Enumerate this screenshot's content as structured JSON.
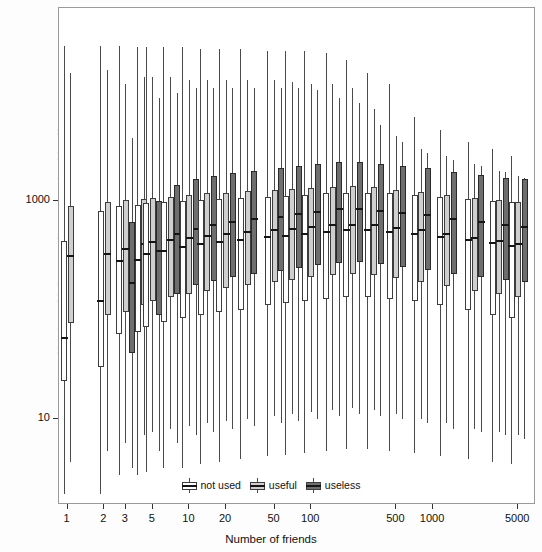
{
  "chart_data": {
    "type": "boxplot",
    "title": "",
    "xlabel": "Number of friends",
    "ylabel": "Number of followers of users used to identify you",
    "xscale": "log",
    "yscale": "log",
    "xlim": [
      0.85,
      7000
    ],
    "ylim": [
      1.6,
      60000
    ],
    "x_ticks": [
      {
        "value": 1,
        "label": "1"
      },
      {
        "value": 2,
        "label": "2"
      },
      {
        "value": 3,
        "label": "3"
      },
      {
        "value": 5,
        "label": "5"
      },
      {
        "value": 10,
        "label": "10"
      },
      {
        "value": 20,
        "label": "20"
      },
      {
        "value": 50,
        "label": "50"
      },
      {
        "value": 100,
        "label": "100"
      },
      {
        "value": 500,
        "label": "500"
      },
      {
        "value": 1000,
        "label": "1000"
      },
      {
        "value": 5000,
        "label": "5000"
      }
    ],
    "y_ticks": [
      {
        "value": 10,
        "label": "10"
      },
      {
        "value": 1000,
        "label": "1000"
      }
    ],
    "grid": false,
    "legend_position": "bottom-center",
    "series": [
      {
        "name": "not used",
        "fill": "#ffffff",
        "stroke": "#3d3d3d"
      },
      {
        "name": "useful",
        "fill": "#cfcfcf",
        "stroke": "#3d3d3d"
      },
      {
        "name": "useless",
        "fill": "#6e6e6e",
        "stroke": "#2a2a2a"
      }
    ],
    "groups": [
      {
        "x": 1,
        "boxes": [
          {
            "series": "not used",
            "lower_whisker": 2.0,
            "q1": 22,
            "median": 55,
            "q3": 430,
            "upper_whisker": 27000
          },
          {
            "series": "useful",
            "lower_whisker": 4.0,
            "q1": 75,
            "median": 310,
            "q3": 900,
            "upper_whisker": 15000
          }
        ]
      },
      {
        "x": 2,
        "boxes": [
          {
            "series": "not used",
            "lower_whisker": 2.0,
            "q1": 30,
            "median": 120,
            "q3": 820,
            "upper_whisker": 27000
          },
          {
            "series": "useful",
            "lower_whisker": 5.0,
            "q1": 90,
            "median": 330,
            "q3": 980,
            "upper_whisker": 16000
          }
        ]
      },
      {
        "x": 3,
        "boxes": [
          {
            "series": "not used",
            "lower_whisker": 3.0,
            "q1": 60,
            "median": 280,
            "q3": 900,
            "upper_whisker": 27000
          },
          {
            "series": "useful",
            "lower_whisker": 6.0,
            "q1": 95,
            "median": 360,
            "q3": 1020,
            "upper_whisker": 12000
          },
          {
            "series": "useless",
            "lower_whisker": 3.5,
            "q1": 40,
            "median": 175,
            "q3": 640,
            "upper_whisker": 3800
          }
        ]
      },
      {
        "x": 4,
        "boxes": [
          {
            "series": "not used",
            "lower_whisker": 3.0,
            "q1": 62,
            "median": 290,
            "q3": 930,
            "upper_whisker": 26000
          },
          {
            "series": "useful",
            "lower_whisker": 7.0,
            "q1": 110,
            "median": 400,
            "q3": 1050,
            "upper_whisker": 14000
          }
        ]
      },
      {
        "x": 5,
        "boxes": [
          {
            "series": "not used",
            "lower_whisker": 3.2,
            "q1": 70,
            "median": 330,
            "q3": 960,
            "upper_whisker": 26000
          },
          {
            "series": "useful",
            "lower_whisker": 7.5,
            "q1": 120,
            "median": 420,
            "q3": 1080,
            "upper_whisker": 14000
          },
          {
            "series": "useless",
            "lower_whisker": 5.0,
            "q1": 90,
            "median": 350,
            "q3": 1000,
            "upper_whisker": 9000
          }
        ]
      },
      {
        "x": 7,
        "boxes": [
          {
            "series": "not used",
            "lower_whisker": 3.5,
            "q1": 78,
            "median": 350,
            "q3": 980,
            "upper_whisker": 26000
          },
          {
            "series": "useful",
            "lower_whisker": 8.0,
            "q1": 130,
            "median": 440,
            "q3": 1100,
            "upper_whisker": 14000
          },
          {
            "series": "useless",
            "lower_whisker": 6.0,
            "q1": 140,
            "median": 500,
            "q3": 1400,
            "upper_whisker": 10000
          }
        ]
      },
      {
        "x": 10,
        "boxes": [
          {
            "series": "not used",
            "lower_whisker": 3.5,
            "q1": 85,
            "median": 380,
            "q3": 1000,
            "upper_whisker": 26000
          },
          {
            "series": "useful",
            "lower_whisker": 8.5,
            "q1": 140,
            "median": 460,
            "q3": 1150,
            "upper_whisker": 13000
          },
          {
            "series": "useless",
            "lower_whisker": 7.0,
            "q1": 170,
            "median": 560,
            "q3": 1600,
            "upper_whisker": 11000
          }
        ]
      },
      {
        "x": 14,
        "boxes": [
          {
            "series": "not used",
            "lower_whisker": 3.8,
            "q1": 90,
            "median": 400,
            "q3": 1020,
            "upper_whisker": 25000
          },
          {
            "series": "useful",
            "lower_whisker": 9.0,
            "q1": 150,
            "median": 480,
            "q3": 1180,
            "upper_whisker": 13000
          },
          {
            "series": "useless",
            "lower_whisker": 7.5,
            "q1": 185,
            "median": 600,
            "q3": 1700,
            "upper_whisker": 11000
          }
        ]
      },
      {
        "x": 20,
        "boxes": [
          {
            "series": "not used",
            "lower_whisker": 4.0,
            "q1": 95,
            "median": 420,
            "q3": 1050,
            "upper_whisker": 25000
          },
          {
            "series": "useful",
            "lower_whisker": 9.5,
            "q1": 160,
            "median": 500,
            "q3": 1200,
            "upper_whisker": 13000
          },
          {
            "series": "useless",
            "lower_whisker": 8.0,
            "q1": 200,
            "median": 640,
            "q3": 1800,
            "upper_whisker": 11000
          }
        ]
      },
      {
        "x": 30,
        "boxes": [
          {
            "series": "not used",
            "lower_whisker": 4.2,
            "q1": 100,
            "median": 440,
            "q3": 1080,
            "upper_whisker": 25000
          },
          {
            "series": "useful",
            "lower_whisker": 10.0,
            "q1": 170,
            "median": 520,
            "q3": 1250,
            "upper_whisker": 13000
          },
          {
            "series": "useless",
            "lower_whisker": 8.5,
            "q1": 215,
            "median": 680,
            "q3": 1900,
            "upper_whisker": 11000
          }
        ]
      },
      {
        "x": 50,
        "boxes": [
          {
            "series": "not used",
            "lower_whisker": 4.5,
            "q1": 110,
            "median": 470,
            "q3": 1100,
            "upper_whisker": 24000
          },
          {
            "series": "useful",
            "lower_whisker": 10.5,
            "q1": 180,
            "median": 540,
            "q3": 1280,
            "upper_whisker": 13000
          },
          {
            "series": "useless",
            "lower_whisker": 9.0,
            "q1": 230,
            "median": 720,
            "q3": 2000,
            "upper_whisker": 11000
          }
        ]
      },
      {
        "x": 70,
        "boxes": [
          {
            "series": "not used",
            "lower_whisker": 4.6,
            "q1": 115,
            "median": 480,
            "q3": 1120,
            "upper_whisker": 24000
          },
          {
            "series": "useful",
            "lower_whisker": 11.0,
            "q1": 190,
            "median": 560,
            "q3": 1300,
            "upper_whisker": 12500
          },
          {
            "series": "useless",
            "lower_whisker": 9.5,
            "q1": 245,
            "median": 760,
            "q3": 2100,
            "upper_whisker": 11000
          }
        ]
      },
      {
        "x": 100,
        "boxes": [
          {
            "series": "not used",
            "lower_whisker": 4.8,
            "q1": 120,
            "median": 500,
            "q3": 1150,
            "upper_whisker": 24000
          },
          {
            "series": "useful",
            "lower_whisker": 11.5,
            "q1": 200,
            "median": 580,
            "q3": 1320,
            "upper_whisker": 12000
          },
          {
            "series": "useless",
            "lower_whisker": 10.0,
            "q1": 260,
            "median": 800,
            "q3": 2200,
            "upper_whisker": 10500
          }
        ]
      },
      {
        "x": 150,
        "boxes": [
          {
            "series": "not used",
            "lower_whisker": 5.0,
            "q1": 125,
            "median": 520,
            "q3": 1180,
            "upper_whisker": 23000
          },
          {
            "series": "useful",
            "lower_whisker": 12.0,
            "q1": 210,
            "median": 600,
            "q3": 1350,
            "upper_whisker": 12000
          },
          {
            "series": "useless",
            "lower_whisker": 10.5,
            "q1": 270,
            "median": 840,
            "q3": 2300,
            "upper_whisker": 9000
          }
        ]
      },
      {
        "x": 220,
        "boxes": [
          {
            "series": "not used",
            "lower_whisker": 5.2,
            "q1": 130,
            "median": 540,
            "q3": 1200,
            "upper_whisker": 20000
          },
          {
            "series": "useful",
            "lower_whisker": 12.5,
            "q1": 215,
            "median": 610,
            "q3": 1380,
            "upper_whisker": 11000
          },
          {
            "series": "useless",
            "lower_whisker": 11.0,
            "q1": 275,
            "median": 850,
            "q3": 2300,
            "upper_whisker": 8000
          }
        ]
      },
      {
        "x": 330,
        "boxes": [
          {
            "series": "not used",
            "lower_whisker": 5.2,
            "q1": 130,
            "median": 540,
            "q3": 1200,
            "upper_whisker": 15000
          },
          {
            "series": "useful",
            "lower_whisker": 12.0,
            "q1": 210,
            "median": 600,
            "q3": 1350,
            "upper_whisker": 7000
          },
          {
            "series": "useless",
            "lower_whisker": 10.5,
            "q1": 265,
            "median": 820,
            "q3": 2200,
            "upper_whisker": 5000
          }
        ]
      },
      {
        "x": 500,
        "boxes": [
          {
            "series": "not used",
            "lower_whisker": 5.0,
            "q1": 125,
            "median": 520,
            "q3": 1180,
            "upper_whisker": 12000
          },
          {
            "series": "useful",
            "lower_whisker": 11.0,
            "q1": 195,
            "median": 570,
            "q3": 1280,
            "upper_whisker": 4000
          },
          {
            "series": "useless",
            "lower_whisker": 10.0,
            "q1": 250,
            "median": 780,
            "q3": 2100,
            "upper_whisker": 3500
          }
        ]
      },
      {
        "x": 800,
        "boxes": [
          {
            "series": "not used",
            "lower_whisker": 4.8,
            "q1": 120,
            "median": 500,
            "q3": 1150,
            "upper_whisker": 6000
          },
          {
            "series": "useful",
            "lower_whisker": 10.0,
            "q1": 180,
            "median": 540,
            "q3": 1220,
            "upper_whisker": 3000
          },
          {
            "series": "useless",
            "lower_whisker": 9.0,
            "q1": 235,
            "median": 740,
            "q3": 2000,
            "upper_whisker": 2800
          }
        ]
      },
      {
        "x": 1300,
        "boxes": [
          {
            "series": "not used",
            "lower_whisker": 4.5,
            "q1": 110,
            "median": 470,
            "q3": 1100,
            "upper_whisker": 4500
          },
          {
            "series": "useful",
            "lower_whisker": 9.0,
            "q1": 165,
            "median": 500,
            "q3": 1150,
            "upper_whisker": 2600
          },
          {
            "series": "useless",
            "lower_whisker": 8.0,
            "q1": 215,
            "median": 680,
            "q3": 1850,
            "upper_whisker": 2400
          }
        ]
      },
      {
        "x": 2200,
        "boxes": [
          {
            "series": "not used",
            "lower_whisker": 4.2,
            "q1": 100,
            "median": 440,
            "q3": 1050,
            "upper_whisker": 3500
          },
          {
            "series": "useful",
            "lower_whisker": 8.0,
            "q1": 150,
            "median": 460,
            "q3": 1080,
            "upper_whisker": 2200
          },
          {
            "series": "useless",
            "lower_whisker": 7.5,
            "q1": 200,
            "median": 640,
            "q3": 1750,
            "upper_whisker": 2100
          }
        ]
      },
      {
        "x": 3500,
        "boxes": [
          {
            "series": "not used",
            "lower_whisker": 4.0,
            "q1": 90,
            "median": 410,
            "q3": 1000,
            "upper_whisker": 3000
          },
          {
            "series": "useful",
            "lower_whisker": 7.5,
            "q1": 140,
            "median": 430,
            "q3": 1020,
            "upper_whisker": 1900
          },
          {
            "series": "useless",
            "lower_whisker": 7.0,
            "q1": 190,
            "median": 600,
            "q3": 1650,
            "upper_whisker": 1850
          }
        ]
      },
      {
        "x": 5000,
        "boxes": [
          {
            "series": "not used",
            "lower_whisker": 3.8,
            "q1": 85,
            "median": 390,
            "q3": 980,
            "upper_whisker": 2600
          },
          {
            "series": "useful",
            "lower_whisker": 7.0,
            "q1": 130,
            "median": 400,
            "q3": 990,
            "upper_whisker": 1700
          },
          {
            "series": "useless",
            "lower_whisker": 6.5,
            "q1": 180,
            "median": 580,
            "q3": 1600,
            "upper_whisker": 1650
          }
        ]
      }
    ]
  },
  "legend": {
    "items": [
      {
        "label": "not used",
        "fill": "#ffffff"
      },
      {
        "label": "useful",
        "fill": "#cfcfcf"
      },
      {
        "label": "useless",
        "fill": "#6e6e6e"
      }
    ]
  }
}
